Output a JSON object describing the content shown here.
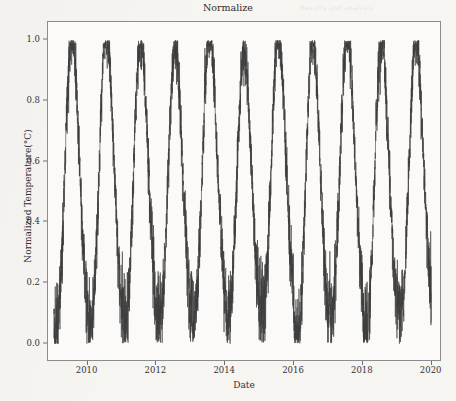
{
  "figure": {
    "title": "Normalize",
    "background_color": "#f6f5f2",
    "axes_background": "#fbfaf8",
    "line_color": "#3d3d3d"
  },
  "background_bleed_text": [
    {
      "text": "Results and analysis",
      "x": 300,
      "y": 4,
      "size": 6.5
    },
    {
      "text": "plot the normalized value from ASOS and ship data by the same",
      "x": 92,
      "y": 38,
      "size": 6.2
    },
    {
      "text": "for 20% Asian country IMAB and its observation temperature index",
      "x": 74,
      "y": 48,
      "size": 6.2
    },
    {
      "text": "be most comparable",
      "x": 300,
      "y": 58,
      "size": 6.2
    },
    {
      "text": "The same seasonal amplitude remains stable across the decade",
      "x": 108,
      "y": 228,
      "size": 6.2
    },
    {
      "text": "and the winter minima show a slightly increasing trend",
      "x": 120,
      "y": 240,
      "size": 6.2
    },
    {
      "text": "Figure 4",
      "x": 330,
      "y": 318,
      "size": 6.2
    }
  ],
  "chart_data": {
    "type": "line",
    "title": "Normalize",
    "xlabel": "Date",
    "ylabel": "Normalized Temperature(°C)",
    "xlim": [
      2008.85,
      2020.3
    ],
    "ylim": [
      -0.06,
      1.06
    ],
    "grid": false,
    "legend": null,
    "xticks": [
      2010,
      2012,
      2014,
      2016,
      2018,
      2020
    ],
    "xtick_labels": [
      "2010",
      "2012",
      "2014",
      "2016",
      "2018",
      "2020"
    ],
    "yticks": [
      0.0,
      0.2,
      0.4,
      0.6,
      0.8,
      1.0
    ],
    "ytick_labels": [
      "0.0",
      "0.2",
      "0.4",
      "0.6",
      "0.8",
      "1.0"
    ],
    "series": [
      {
        "name": "normalized temperature",
        "color": "#3d3d3d",
        "linewidth": 0.6,
        "description": "Daily normalized temperature, strongly seasonal annual cycle with high-frequency daily noise, spanning early 2009 through early 2020.",
        "x_start": 2009.02,
        "x_end": 2019.99,
        "samples_per_year": 365,
        "seasonal_model": {
          "annual_mean": 0.52,
          "annual_amplitude": 0.36,
          "phase_peak_fraction": 0.56,
          "daily_noise_sd": 0.075,
          "semiannual_amplitude": 0.035
        },
        "yearly_extremes": [
          {
            "year": 2009,
            "min": 0.03,
            "max": 0.98
          },
          {
            "year": 2010,
            "min": 0.04,
            "max": 0.99
          },
          {
            "year": 2011,
            "min": 0.06,
            "max": 0.95
          },
          {
            "year": 2012,
            "min": 0.06,
            "max": 0.93
          },
          {
            "year": 2013,
            "min": 0.08,
            "max": 1.0
          },
          {
            "year": 2014,
            "min": 0.07,
            "max": 0.92
          },
          {
            "year": 2015,
            "min": 0.09,
            "max": 0.98
          },
          {
            "year": 2016,
            "min": 0.0,
            "max": 0.96
          },
          {
            "year": 2017,
            "min": 0.09,
            "max": 0.99
          },
          {
            "year": 2018,
            "min": 0.02,
            "max": 0.95
          },
          {
            "year": 2019,
            "min": 0.09,
            "max": 0.96
          },
          {
            "year": 2020,
            "min": 0.14,
            "max": 0.4
          }
        ]
      }
    ]
  }
}
